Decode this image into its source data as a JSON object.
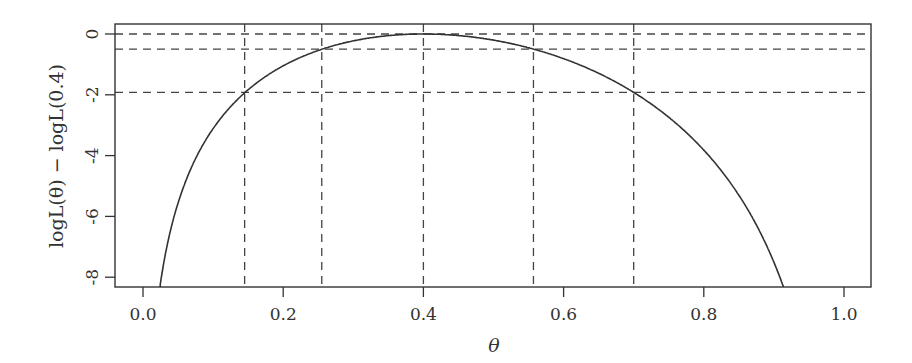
{
  "chart_data": {
    "type": "line",
    "title": "",
    "xlabel": "θ",
    "ylabel": "logL(θ) − logL(0.4)",
    "xlim": [
      -0.04,
      1.04
    ],
    "ylim": [
      -8.3,
      0.3
    ],
    "grid": false,
    "legend": null,
    "x_ticks": [
      0.0,
      0.2,
      0.4,
      0.6,
      0.8,
      1.0
    ],
    "x_tick_labels": [
      "0.0",
      "0.2",
      "0.4",
      "0.6",
      "0.8",
      "1.0"
    ],
    "y_ticks": [
      0,
      -2,
      -4,
      -6,
      -8
    ],
    "y_tick_labels": [
      "0",
      "-2",
      "-4",
      "-6",
      "-8"
    ],
    "series": [
      {
        "name": "relative binomial log-likelihood (n=10, x=4)",
        "style": "solid",
        "model": {
          "n": 10,
          "x": 4,
          "mle": 0.4
        },
        "x": [
          0.03,
          0.05,
          0.1,
          0.145,
          0.2,
          0.255,
          0.3,
          0.35,
          0.4,
          0.45,
          0.5,
          0.557,
          0.6,
          0.65,
          0.7,
          0.75,
          0.8,
          0.85,
          0.9,
          0.914
        ],
        "values": [
          -6.69,
          -5.04,
          -2.73,
          -1.93,
          -0.81,
          -0.5,
          -0.22,
          -0.05,
          0.0,
          -0.05,
          -0.2,
          -0.5,
          -0.74,
          -1.21,
          -1.92,
          -2.86,
          -4.22,
          -5.98,
          -8.25,
          -8.3
        ]
      }
    ],
    "reference_lines": {
      "horizontal_dashed": [
        0,
        -0.5,
        -1.92
      ],
      "vertical_dashed": [
        0.145,
        0.255,
        0.4,
        0.557,
        0.7
      ]
    },
    "annotations": []
  }
}
